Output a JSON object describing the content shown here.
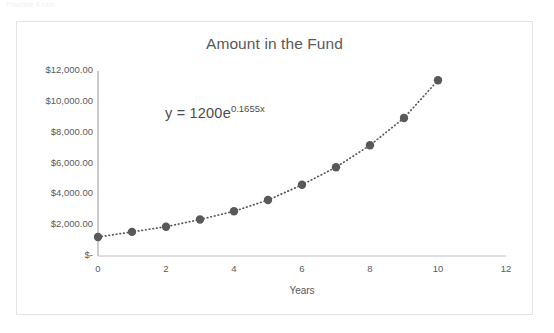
{
  "scan_artifact": {
    "text": "Practice Exam"
  },
  "chart_data": {
    "type": "scatter",
    "title": "Amount in the Fund",
    "xlabel": "Years",
    "ylabel": "",
    "annotation": {
      "base": "y = 1200e",
      "exponent": "0.1655x",
      "full": "y = 1200e^0.1655x"
    },
    "x": [
      0,
      1,
      2,
      3,
      4,
      5,
      6,
      7,
      8,
      9,
      10
    ],
    "values": [
      1200,
      1416,
      1671,
      1972,
      2327,
      2746,
      3241,
      3824,
      4513,
      5326,
      6284
    ],
    "plotted_values": [
      1230,
      1560,
      1900,
      2370,
      2900,
      3630,
      4620,
      5760,
      7180,
      8950,
      11400
    ],
    "xlim": [
      0,
      12
    ],
    "ylim": [
      0,
      12000
    ],
    "xticks": [
      0,
      2,
      4,
      6,
      8,
      10,
      12
    ],
    "xtick_labels": [
      "0",
      "2",
      "4",
      "6",
      "8",
      "10",
      "12"
    ],
    "yticks": [
      0,
      2000,
      4000,
      6000,
      8000,
      10000,
      12000
    ],
    "ytick_labels": [
      "$-",
      "$2,000.00",
      "$4,000.00",
      "$6,000.00",
      "$8,000.00",
      "$10,000.00",
      "$12,000.00"
    ],
    "grid": false,
    "legend": false,
    "series_style": {
      "line": "dotted",
      "marker": "circle",
      "color": "#595959"
    },
    "colors": {
      "marker": "#595959",
      "line": "#595959",
      "axis": "#bfbfbf",
      "text": "#585858",
      "frame_border": "#e2e3e5"
    }
  }
}
